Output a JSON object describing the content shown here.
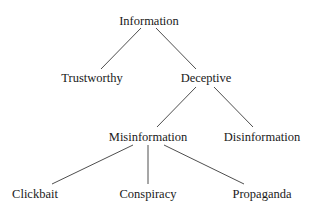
{
  "diagram": {
    "type": "tree",
    "nodes": [
      {
        "id": "information",
        "label": "Information",
        "x": 149,
        "y": 15
      },
      {
        "id": "trustworthy",
        "label": "Trustworthy",
        "x": 92,
        "y": 72
      },
      {
        "id": "deceptive",
        "label": "Deceptive",
        "x": 206,
        "y": 72
      },
      {
        "id": "misinformation",
        "label": "Misinformation",
        "x": 148,
        "y": 131
      },
      {
        "id": "disinformation",
        "label": "Disinformation",
        "x": 262,
        "y": 131
      },
      {
        "id": "clickbait",
        "label": "Clickbait",
        "x": 35,
        "y": 188
      },
      {
        "id": "conspiracy",
        "label": "Conspiracy",
        "x": 148,
        "y": 188
      },
      {
        "id": "propaganda",
        "label": "Propaganda",
        "x": 262,
        "y": 188
      }
    ],
    "edges": [
      {
        "from": "information",
        "to": "trustworthy",
        "x1": 141,
        "y1": 28,
        "x2": 101,
        "y2": 69
      },
      {
        "from": "information",
        "to": "deceptive",
        "x1": 156,
        "y1": 28,
        "x2": 196,
        "y2": 69
      },
      {
        "from": "deceptive",
        "to": "misinformation",
        "x1": 196,
        "y1": 87,
        "x2": 157,
        "y2": 127
      },
      {
        "from": "deceptive",
        "to": "disinformation",
        "x1": 214,
        "y1": 87,
        "x2": 253,
        "y2": 127
      },
      {
        "from": "misinformation",
        "to": "clickbait",
        "x1": 133,
        "y1": 145,
        "x2": 52,
        "y2": 184
      },
      {
        "from": "misinformation",
        "to": "conspiracy",
        "x1": 148,
        "y1": 145,
        "x2": 148,
        "y2": 184
      },
      {
        "from": "misinformation",
        "to": "propaganda",
        "x1": 164,
        "y1": 145,
        "x2": 244,
        "y2": 184
      }
    ]
  }
}
